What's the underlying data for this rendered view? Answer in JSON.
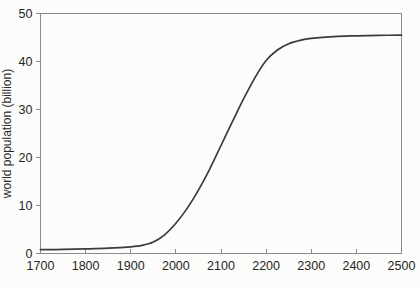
{
  "figure": {
    "background": "#fcfcfa",
    "frame_color": "#8c8c8c",
    "tick_color": "#8c8c8c",
    "text_color": "#262626"
  },
  "chart_data": {
    "type": "line",
    "title": "",
    "xlabel": "",
    "ylabel": "world population (billion)",
    "xlim": [
      1700,
      2500
    ],
    "ylim": [
      0,
      50
    ],
    "x_ticks": [
      1700,
      1800,
      1900,
      2000,
      2100,
      2200,
      2300,
      2400,
      2500
    ],
    "y_ticks": [
      0,
      10,
      20,
      30,
      40,
      50
    ],
    "grid": false,
    "frame": true,
    "legend_position": "none",
    "series": [
      {
        "name": "world population (logistic projection)",
        "color": "#3b3b3b",
        "line_width": 1.7,
        "x": [
          1700,
          1750,
          1800,
          1850,
          1900,
          1925,
          1950,
          1975,
          2000,
          2025,
          2050,
          2075,
          2100,
          2125,
          2150,
          2175,
          2200,
          2225,
          2250,
          2275,
          2300,
          2350,
          2400,
          2450,
          2500
        ],
        "y": [
          0.8,
          0.85,
          0.95,
          1.1,
          1.4,
          1.7,
          2.4,
          3.9,
          6.3,
          9.4,
          13.2,
          17.6,
          22.5,
          27.4,
          32.2,
          36.6,
          40.2,
          42.4,
          43.7,
          44.4,
          44.8,
          45.2,
          45.35,
          45.45,
          45.5
        ]
      }
    ]
  }
}
